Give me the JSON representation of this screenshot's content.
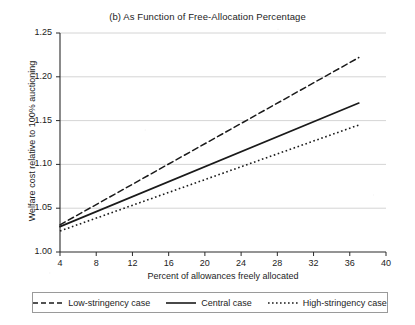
{
  "chart_data": {
    "type": "line",
    "title": "(b) As Function of Free-Allocation Percentage",
    "xlabel": "Percent of allowances freely allocated",
    "ylabel": "Welfare cost relative to 100% auctioning",
    "xlim": [
      4,
      40
    ],
    "ylim": [
      1.0,
      1.25
    ],
    "xticks": [
      "4",
      "8",
      "12",
      "16",
      "20",
      "24",
      "28",
      "32",
      "36",
      "40"
    ],
    "xtick_values": [
      4,
      8,
      12,
      16,
      20,
      24,
      28,
      32,
      36,
      40
    ],
    "yticks": [
      "1.00",
      "1.05",
      "1.10",
      "1.15",
      "1.20",
      "1.25"
    ],
    "ytick_values": [
      1.0,
      1.05,
      1.1,
      1.15,
      1.2,
      1.25
    ],
    "grid": "horizontal",
    "legend_position": "below-axes",
    "series": [
      {
        "name": "Low-stringency case",
        "style": "dashed",
        "color": "#1a1a1a",
        "x": [
          4,
          37
        ],
        "values": [
          1.031,
          1.222
        ]
      },
      {
        "name": "Central case",
        "style": "solid",
        "color": "#1a1a1a",
        "x": [
          4,
          37
        ],
        "values": [
          1.029,
          1.17
        ]
      },
      {
        "name": "High-stringency case",
        "style": "dotted",
        "color": "#1a1a1a",
        "x": [
          4,
          37
        ],
        "values": [
          1.024,
          1.145
        ]
      }
    ]
  },
  "legend": {
    "entries": [
      {
        "label": "Low-stringency case"
      },
      {
        "label": "Central case"
      },
      {
        "label": "High-stringency case"
      }
    ]
  }
}
